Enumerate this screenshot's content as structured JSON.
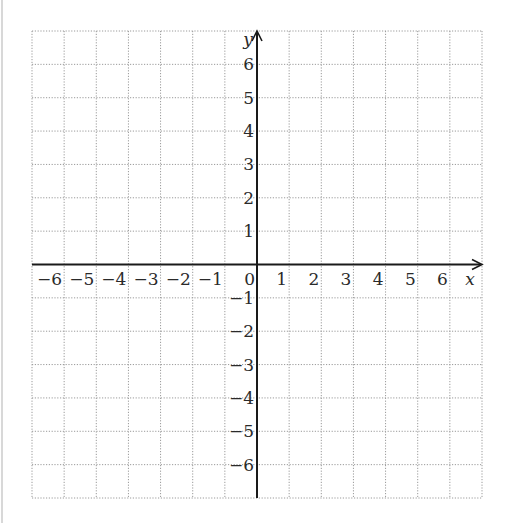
{
  "diagram": {
    "type": "coordinate-grid",
    "x_axis": {
      "label": "x",
      "min": -7,
      "max": 7,
      "tick_labels": [
        "−6",
        "−5",
        "−4",
        "−3",
        "−2",
        "−1",
        "0",
        "1",
        "2",
        "3",
        "4",
        "5",
        "6"
      ],
      "arrow": "positive"
    },
    "y_axis": {
      "label": "y",
      "min": -7,
      "max": 7,
      "tick_labels_positive": [
        "1",
        "2",
        "3",
        "4",
        "5",
        "6"
      ],
      "tick_labels_negative": [
        "−1",
        "−2",
        "−3",
        "−4",
        "−5",
        "−6"
      ],
      "arrow": "positive"
    },
    "grid": {
      "columns": 14,
      "rows": 14,
      "style": "dotted",
      "color": "#9a9a9a"
    },
    "axis_color": "#1a1a1a",
    "origin_label": "0"
  }
}
